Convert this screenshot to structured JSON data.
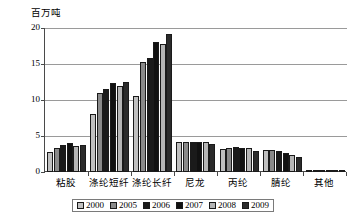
{
  "chart_data": {
    "type": "bar",
    "title": "",
    "subtitle": "",
    "ylabel": "百万吨",
    "xlabel": "",
    "ylim": [
      0,
      20
    ],
    "yticks": [
      0,
      5,
      10,
      15,
      20
    ],
    "ytick_labels": [
      "0",
      "5",
      "10",
      "15",
      "20"
    ],
    "grid": true,
    "legend_position": "bottom",
    "categories": [
      "粘胶",
      "涤纶短纤",
      "涤纶长纤",
      "尼龙",
      "丙纶",
      "腈纶",
      "其他"
    ],
    "series": [
      {
        "name": "2000",
        "color": "#c0c0c0",
        "values": [
          2.8,
          8.1,
          10.5,
          4.1,
          3.2,
          3.1,
          0.1
        ]
      },
      {
        "name": "2005",
        "color": "#8a8a8a",
        "values": [
          3.4,
          11.0,
          15.3,
          4.2,
          3.4,
          3.0,
          0.2
        ]
      },
      {
        "name": "2006",
        "color": "#1a1a1a",
        "values": [
          3.7,
          11.5,
          15.8,
          4.2,
          3.5,
          2.9,
          0.3
        ]
      },
      {
        "name": "2007",
        "color": "#111111",
        "values": [
          4.0,
          12.3,
          18.1,
          4.2,
          3.4,
          2.7,
          0.3
        ]
      },
      {
        "name": "2008",
        "color": "#b5b5b5",
        "values": [
          3.6,
          12.0,
          17.8,
          4.1,
          3.3,
          2.4,
          0.25
        ]
      },
      {
        "name": "2009",
        "color": "#2b2b2b",
        "values": [
          3.8,
          12.5,
          19.1,
          3.9,
          2.9,
          2.1,
          0.3
        ]
      }
    ]
  },
  "axis": {
    "y_title": "百万吨"
  }
}
